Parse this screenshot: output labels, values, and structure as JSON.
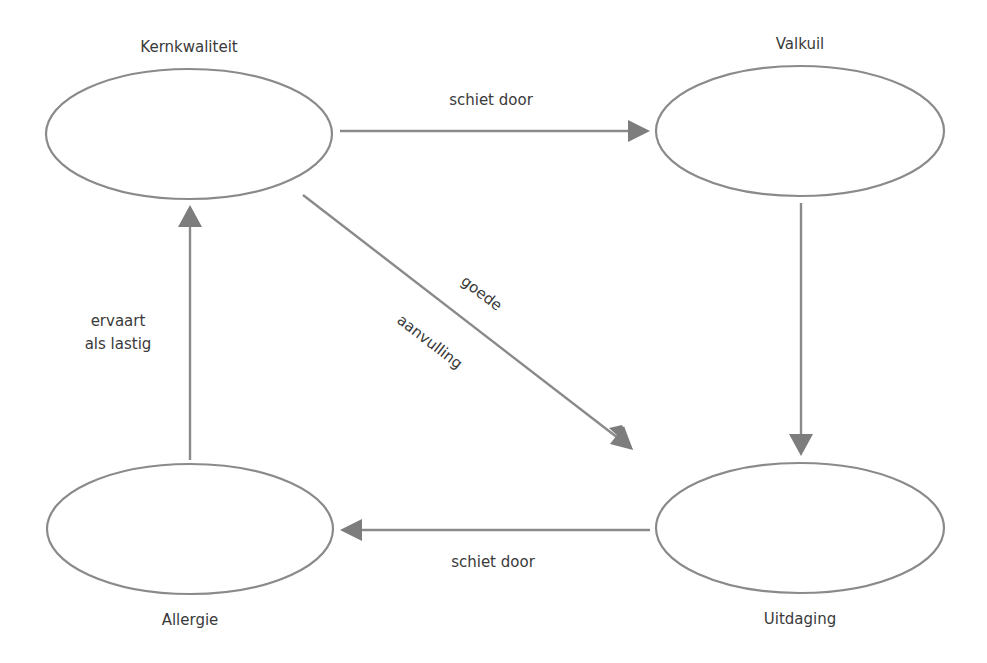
{
  "diagram": {
    "type": "kernkwadrant",
    "nodes": [
      {
        "id": "kernkwaliteit",
        "label": "Kernkwaliteit",
        "position": "top-left"
      },
      {
        "id": "valkuil",
        "label": "Valkuil",
        "position": "top-right"
      },
      {
        "id": "allergie",
        "label": "Allergie",
        "position": "bottom-left"
      },
      {
        "id": "uitdaging",
        "label": "Uitdaging",
        "position": "bottom-right"
      }
    ],
    "edges": [
      {
        "from": "kernkwaliteit",
        "to": "valkuil",
        "label": "schiet door"
      },
      {
        "from": "valkuil",
        "to": "uitdaging",
        "label": ""
      },
      {
        "from": "kernkwaliteit",
        "to": "uitdaging",
        "label_line1": "goede",
        "label_line2": "aanvulling"
      },
      {
        "from": "uitdaging",
        "to": "allergie",
        "label": "schiet door"
      },
      {
        "from": "allergie",
        "to": "kernkwaliteit",
        "label_line1": "ervaart",
        "label_line2": "als lastig"
      }
    ],
    "colors": {
      "stroke": "#8a8a8a",
      "arrow": "#7d7d7d",
      "text": "#3a3a3a",
      "background": "#ffffff"
    }
  }
}
